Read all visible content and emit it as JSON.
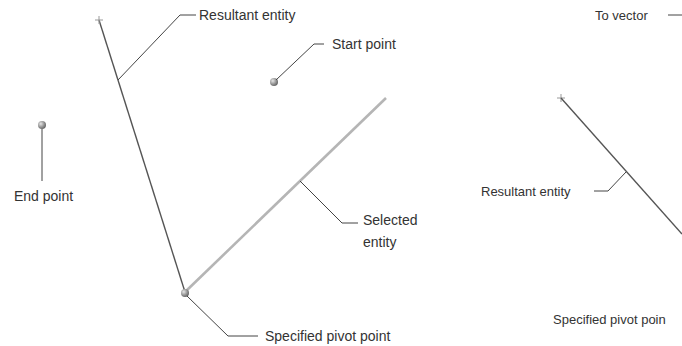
{
  "left_diagram": {
    "labels": {
      "resultant_entity": "Resultant entity",
      "start_point": "Start point",
      "end_point": "End point",
      "selected_entity_line1": "Selected",
      "selected_entity_line2": "entity",
      "specified_pivot_point": "Specified pivot point"
    }
  },
  "right_diagram": {
    "labels": {
      "to_vector": "To vector",
      "resultant_entity": "Resultant entity",
      "specified_pivot_point": "Specified pivot poin"
    }
  },
  "colors": {
    "text": "#333333",
    "leader": "#444444",
    "resultant_line": "#555555",
    "selected_line": "#b5b5b5",
    "point": "#9a9a9a"
  }
}
